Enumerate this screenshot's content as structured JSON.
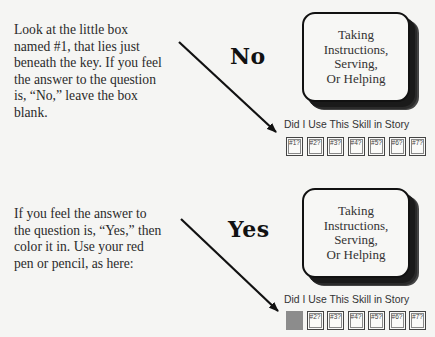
{
  "example_no": {
    "instruction": "Look at the little box named #1, that lies just beneath the key. If you feel the answer to the question is, “No,” leave the box blank.",
    "answer_label": "No",
    "skill_card": "Taking Instructions, Serving, Or Helping",
    "skill_lines": [
      "Taking",
      "Instructions,",
      "Serving,",
      "Or Helping"
    ],
    "tracker_caption": "Did I Use This Skill in Story",
    "boxes": [
      {
        "label": "#1?",
        "filled": false
      },
      {
        "label": "#2?",
        "filled": false
      },
      {
        "label": "#3?",
        "filled": false
      },
      {
        "label": "#4?",
        "filled": false
      },
      {
        "label": "#5?",
        "filled": false
      },
      {
        "label": "#6?",
        "filled": false
      },
      {
        "label": "#7?",
        "filled": false
      }
    ]
  },
  "example_yes": {
    "instruction": "If you feel the answer to the question is, “Yes,” then color it in. Use your red pen or pencil, as here:",
    "answer_label": "Yes",
    "skill_lines": [
      "Taking",
      "Instructions,",
      "Serving,",
      "Or Helping"
    ],
    "tracker_caption": "Did I Use This Skill in Story",
    "boxes": [
      {
        "label": "",
        "filled": true
      },
      {
        "label": "#2?",
        "filled": false
      },
      {
        "label": "#3?",
        "filled": false
      },
      {
        "label": "#4?",
        "filled": false
      },
      {
        "label": "#5?",
        "filled": false
      },
      {
        "label": "#6?",
        "filled": false
      },
      {
        "label": "#7?",
        "filled": false
      }
    ]
  },
  "colors": {
    "filled_box": "#8c8c8c",
    "background": "#f5f5f3",
    "ink": "#111111"
  }
}
